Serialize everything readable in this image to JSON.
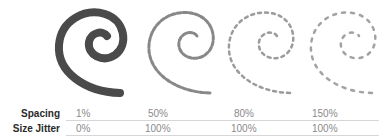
{
  "illustrations": [
    {
      "name": "spiral-solid",
      "style": "solid"
    },
    {
      "name": "spiral-spacing-50",
      "style": "dashed"
    },
    {
      "name": "spiral-spacing-80",
      "style": "dotted"
    },
    {
      "name": "spiral-spacing-150",
      "style": "sparse"
    }
  ],
  "table": {
    "rows": [
      {
        "label": "Spacing",
        "values": [
          "1%",
          "50%",
          "80%",
          "150%"
        ]
      },
      {
        "label": "Size Jitter",
        "values": [
          "0%",
          "100%",
          "100%",
          "100%"
        ]
      }
    ]
  },
  "colors": {
    "spiral": "#4a4a4a",
    "label": "#2a2a2a",
    "value": "#8a8a8a",
    "divider": "#d6d6d6"
  }
}
